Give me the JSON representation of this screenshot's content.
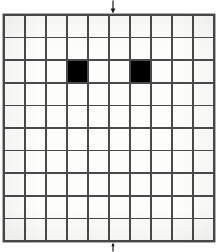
{
  "figure": {
    "background_color": "#fefefe",
    "line_color": "#4a4a4a",
    "fill_color": "#000000"
  },
  "chart_data": {
    "type": "heatmap",
    "title": "",
    "subtitle": "",
    "xlabel": "",
    "ylabel": "",
    "columns": 10,
    "rows": 10,
    "grid": true,
    "legend": "none",
    "xlim": [
      0,
      10
    ],
    "ylim": [
      0,
      10
    ],
    "x": [
      1,
      2,
      3,
      4,
      5,
      6,
      7,
      8,
      9,
      10
    ],
    "categories": [
      "1",
      "2",
      "3",
      "4",
      "5",
      "6",
      "7",
      "8",
      "9",
      "10"
    ],
    "values": [
      [
        0,
        0,
        0,
        0,
        0,
        0,
        0,
        0,
        0,
        0
      ],
      [
        0,
        0,
        0,
        0,
        0,
        0,
        0,
        0,
        0,
        0
      ],
      [
        0,
        0,
        0,
        1,
        0,
        0,
        1,
        0,
        0,
        0
      ],
      [
        0,
        0,
        0,
        0,
        0,
        0,
        0,
        0,
        0,
        0
      ],
      [
        0,
        0,
        0,
        0,
        0,
        0,
        0,
        0,
        0,
        0
      ],
      [
        0,
        0,
        0,
        0,
        0,
        0,
        0,
        0,
        0,
        0
      ],
      [
        0,
        0,
        0,
        0,
        0,
        0,
        0,
        0,
        0,
        0
      ],
      [
        0,
        0,
        0,
        0,
        0,
        0,
        0,
        0,
        0,
        0
      ],
      [
        0,
        0,
        0,
        0,
        0,
        0,
        0,
        0,
        0,
        0
      ],
      [
        0,
        0,
        0,
        0,
        0,
        0,
        0,
        0,
        0,
        0
      ]
    ],
    "filled_cells": [
      {
        "row": 3,
        "column": 4
      },
      {
        "row": 3,
        "column": 7
      }
    ],
    "annotations": [
      {
        "name": "top-axis-arrow",
        "glyph": "down-arrow",
        "position": "top-center",
        "at_column_boundary": 5,
        "label": ""
      },
      {
        "name": "bottom-axis-tick",
        "glyph": "up-tick",
        "position": "bottom-center",
        "at_column_boundary": 5,
        "label": ""
      }
    ]
  }
}
